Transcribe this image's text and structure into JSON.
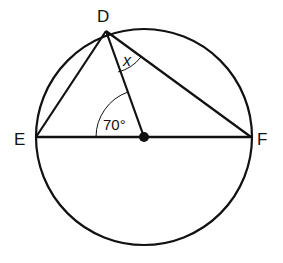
{
  "diagram": {
    "points": {
      "D": {
        "label": "D",
        "x": 106,
        "y": 31
      },
      "E": {
        "label": "E",
        "x": 36,
        "y": 137
      },
      "F": {
        "label": "F",
        "x": 251,
        "y": 137
      },
      "O": {
        "label": "",
        "x": 144,
        "y": 137
      }
    },
    "circle": {
      "cx": 144,
      "cy": 137,
      "r": 108
    },
    "angles": {
      "DOE": {
        "label": "70°"
      },
      "ODF": {
        "label": "x"
      }
    },
    "colors": {
      "stroke": "#111111",
      "background": "#ffffff"
    }
  }
}
